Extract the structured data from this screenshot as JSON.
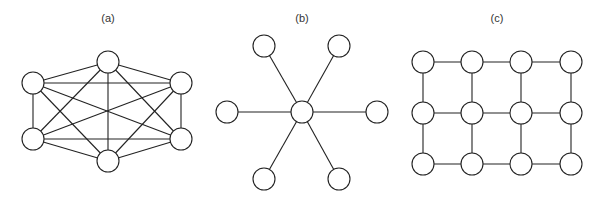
{
  "style": {
    "stroke_color": "#222222",
    "node_fill": "#ffffff",
    "node_radius": 11,
    "edge_width": 1.1,
    "node_stroke_width": 1.1
  },
  "panels": [
    {
      "id": "a",
      "label": "(a)",
      "label_x": 108,
      "type": "complete-graph",
      "description": "Fully connected mesh of 6 nodes",
      "nodes": [
        {
          "id": "a1",
          "x": 33,
          "y": 83
        },
        {
          "id": "a2",
          "x": 108,
          "y": 62
        },
        {
          "id": "a3",
          "x": 181,
          "y": 83
        },
        {
          "id": "a4",
          "x": 181,
          "y": 139
        },
        {
          "id": "a5",
          "x": 108,
          "y": 161
        },
        {
          "id": "a6",
          "x": 33,
          "y": 139
        }
      ],
      "edges": [
        [
          "a1",
          "a2"
        ],
        [
          "a1",
          "a3"
        ],
        [
          "a1",
          "a4"
        ],
        [
          "a1",
          "a5"
        ],
        [
          "a1",
          "a6"
        ],
        [
          "a2",
          "a3"
        ],
        [
          "a2",
          "a4"
        ],
        [
          "a2",
          "a5"
        ],
        [
          "a2",
          "a6"
        ],
        [
          "a3",
          "a4"
        ],
        [
          "a3",
          "a5"
        ],
        [
          "a3",
          "a6"
        ],
        [
          "a4",
          "a5"
        ],
        [
          "a4",
          "a6"
        ],
        [
          "a5",
          "a6"
        ]
      ]
    },
    {
      "id": "b",
      "label": "(b)",
      "label_x": 302,
      "type": "star-graph",
      "description": "Star topology with one hub and 6 leaves",
      "nodes": [
        {
          "id": "b0",
          "x": 302,
          "y": 112
        },
        {
          "id": "b1",
          "x": 264,
          "y": 46
        },
        {
          "id": "b2",
          "x": 339,
          "y": 46
        },
        {
          "id": "b3",
          "x": 227,
          "y": 112
        },
        {
          "id": "b4",
          "x": 377,
          "y": 112
        },
        {
          "id": "b5",
          "x": 264,
          "y": 179
        },
        {
          "id": "b6",
          "x": 339,
          "y": 179
        }
      ],
      "edges": [
        [
          "b0",
          "b1"
        ],
        [
          "b0",
          "b2"
        ],
        [
          "b0",
          "b3"
        ],
        [
          "b0",
          "b4"
        ],
        [
          "b0",
          "b5"
        ],
        [
          "b0",
          "b6"
        ]
      ]
    },
    {
      "id": "c",
      "label": "(c)",
      "label_x": 497,
      "type": "grid-graph",
      "description": "3 x 4 grid (mesh) topology",
      "nodes": [
        {
          "id": "c11",
          "x": 423,
          "y": 62
        },
        {
          "id": "c12",
          "x": 472,
          "y": 62
        },
        {
          "id": "c13",
          "x": 521,
          "y": 62
        },
        {
          "id": "c14",
          "x": 571,
          "y": 62
        },
        {
          "id": "c21",
          "x": 423,
          "y": 113
        },
        {
          "id": "c22",
          "x": 472,
          "y": 113
        },
        {
          "id": "c23",
          "x": 521,
          "y": 113
        },
        {
          "id": "c24",
          "x": 571,
          "y": 113
        },
        {
          "id": "c31",
          "x": 423,
          "y": 164
        },
        {
          "id": "c32",
          "x": 472,
          "y": 164
        },
        {
          "id": "c33",
          "x": 521,
          "y": 164
        },
        {
          "id": "c34",
          "x": 571,
          "y": 164
        }
      ],
      "edges": [
        [
          "c11",
          "c12"
        ],
        [
          "c12",
          "c13"
        ],
        [
          "c13",
          "c14"
        ],
        [
          "c21",
          "c22"
        ],
        [
          "c22",
          "c23"
        ],
        [
          "c23",
          "c24"
        ],
        [
          "c31",
          "c32"
        ],
        [
          "c32",
          "c33"
        ],
        [
          "c33",
          "c34"
        ],
        [
          "c11",
          "c21"
        ],
        [
          "c21",
          "c31"
        ],
        [
          "c12",
          "c22"
        ],
        [
          "c22",
          "c32"
        ],
        [
          "c13",
          "c23"
        ],
        [
          "c23",
          "c33"
        ],
        [
          "c14",
          "c24"
        ],
        [
          "c24",
          "c34"
        ]
      ]
    }
  ]
}
